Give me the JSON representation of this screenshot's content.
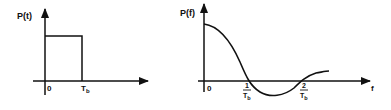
{
  "left_plot": {
    "y_label": "P(t)",
    "origin_label": "0",
    "x_tick_label": "T",
    "x_tick_sub": "b"
  },
  "right_plot": {
    "y_label": "P(f)",
    "origin_label": "0",
    "x_axis_label": "f",
    "tick1_num": "1",
    "tick1_den": "T",
    "tick1_sub": "b",
    "tick2_num": "2",
    "tick2_den": "T",
    "tick2_sub": "b"
  },
  "colors": {
    "ink": "#111111",
    "background": "#ffffff"
  }
}
